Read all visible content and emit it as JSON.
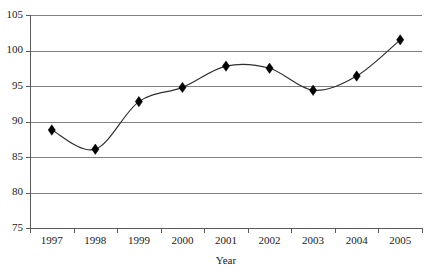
{
  "chart_data": {
    "type": "line",
    "title": "",
    "subtitle": "",
    "xlabel": "Year",
    "ylabel": "",
    "categories": [
      "1997",
      "1998",
      "1999",
      "2000",
      "2001",
      "2002",
      "2003",
      "2004",
      "2005"
    ],
    "values": [
      88.8,
      86.1,
      92.8,
      94.8,
      97.8,
      97.5,
      94.4,
      96.4,
      101.5
    ],
    "series": [
      {
        "name": "",
        "values": [
          88.8,
          86.1,
          92.8,
          94.8,
          97.8,
          97.5,
          94.4,
          96.4,
          101.5
        ]
      }
    ],
    "ylim": [
      75,
      105
    ],
    "yticks": [
      75,
      80,
      85,
      90,
      95,
      100,
      105
    ],
    "ytick_labels": [
      "75",
      "80",
      "85",
      "90",
      "95",
      "100",
      "105"
    ],
    "xtick_labels": [
      "1997",
      "1998",
      "1999",
      "2000",
      "2001",
      "2002",
      "2003",
      "2004",
      "2005"
    ],
    "grid": "horizontal",
    "legend": "none",
    "marker": "diamond",
    "marker_color": "#000000",
    "line_color": "#303030",
    "gridline_color": "#808080",
    "axis_color": "#5a5a5a",
    "background": "#ffffff",
    "annotations": []
  },
  "axes": {
    "y_axis_name": "y-axis",
    "x_axis_name": "x-axis",
    "x_title": "Year"
  }
}
